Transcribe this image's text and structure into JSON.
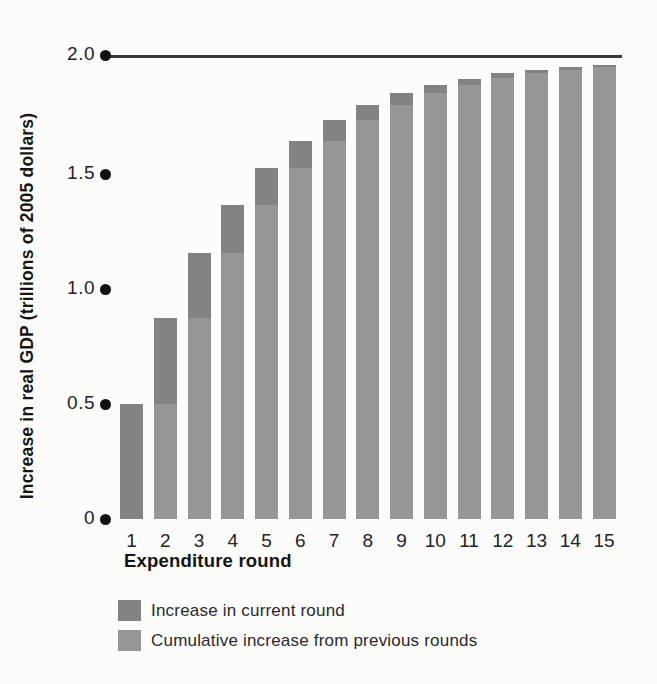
{
  "figure": {
    "background_color": "#fcfcfb",
    "bar_color_current": "#838383",
    "bar_color_cumulative": "#969696",
    "reference_line_color": "#3a3a3a",
    "tick_dot_color": "#101010"
  },
  "chart_data": {
    "type": "bar",
    "stacked": true,
    "title": "",
    "xlabel": "Expenditure round",
    "ylabel": "Increase in real GDP (trillions of 2005 dollars)",
    "categories": [
      "1",
      "2",
      "3",
      "4",
      "5",
      "6",
      "7",
      "8",
      "9",
      "10",
      "11",
      "12",
      "13",
      "14",
      "15"
    ],
    "series": [
      {
        "name": "Increase in current round",
        "color": "#838383",
        "values": [
          0.5,
          0.375,
          0.281,
          0.211,
          0.158,
          0.119,
          0.089,
          0.067,
          0.05,
          0.038,
          0.028,
          0.021,
          0.016,
          0.012,
          0.009
        ]
      },
      {
        "name": "Cumulative increase from previous rounds",
        "color": "#969696",
        "values": [
          0,
          0.5,
          0.875,
          1.156,
          1.367,
          1.525,
          1.644,
          1.733,
          1.8,
          1.85,
          1.887,
          1.916,
          1.937,
          1.952,
          1.964
        ]
      }
    ],
    "stack_totals": [
      0.5,
      0.875,
      1.156,
      1.367,
      1.525,
      1.644,
      1.733,
      1.8,
      1.85,
      1.887,
      1.916,
      1.937,
      1.952,
      1.964,
      1.973
    ],
    "reference_line": {
      "value": 2.0
    },
    "yticks": [
      {
        "value": 0,
        "label": "0"
      },
      {
        "value": 0.5,
        "label": "0.5"
      },
      {
        "value": 1.0,
        "label": "1.0"
      },
      {
        "value": 1.5,
        "label": "1.5"
      },
      {
        "value": 2.0,
        "label": "2.0"
      }
    ],
    "ylim": [
      0,
      2.05
    ],
    "grid": false,
    "legend_position": "bottom-left"
  },
  "legend": {
    "items": [
      {
        "label": "Increase in current round",
        "color": "#838383"
      },
      {
        "label": "Cumulative increase from previous rounds",
        "color": "#969696"
      }
    ]
  }
}
